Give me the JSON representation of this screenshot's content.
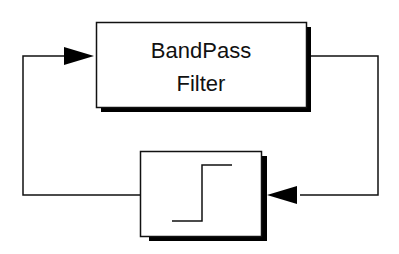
{
  "diagram": {
    "type": "block-diagram",
    "blocks": [
      {
        "id": "bandpass-filter",
        "lines": [
          "BandPass",
          "Filter"
        ]
      },
      {
        "id": "step-function",
        "symbol": "step-icon"
      }
    ],
    "connections": [
      {
        "from": "bandpass-filter",
        "to": "step-function",
        "route": "right side, down, arrow into right of step block"
      },
      {
        "from": "step-function",
        "to": "bandpass-filter",
        "route": "left side, up, arrow into left of filter block"
      }
    ],
    "colors": {
      "stroke": "#111111",
      "background": "#ffffff",
      "shadow": "#000000"
    }
  }
}
